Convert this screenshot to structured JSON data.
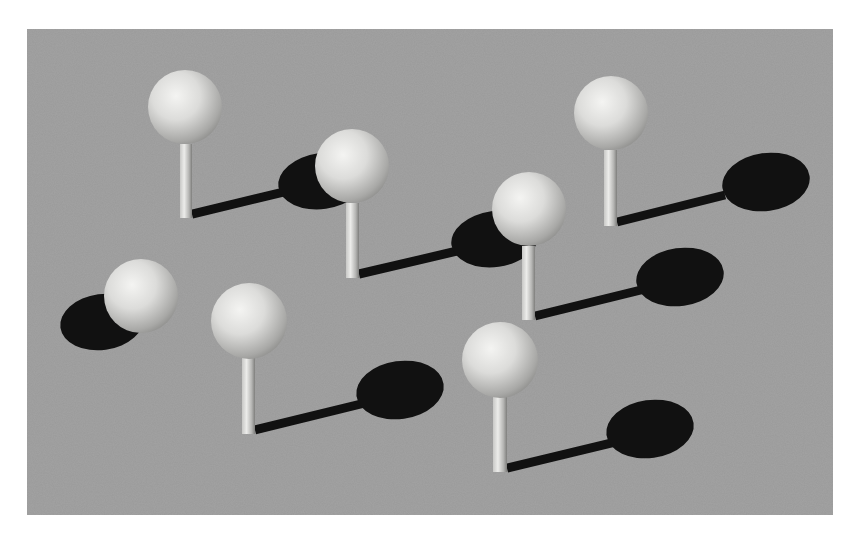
{
  "scene": {
    "description": "3D render of white spheres on short posts casting dark shadows on a gray textured ground plane",
    "panel": {
      "x": 27,
      "y": 29,
      "width": 806,
      "height": 486,
      "color": "#9a9a9a"
    },
    "colors": {
      "ground": "#9a9a9a",
      "shadow": "#111111",
      "sphere_light": "#f2f2f0",
      "sphere_mid": "#d4d4d2",
      "sphere_dark": "#8e8e8c",
      "post_light": "#e6e6e4",
      "post_dark": "#8a8a88"
    },
    "pins": [
      {
        "id": "pin-1",
        "sphere": {
          "cx": 185,
          "cy": 107,
          "r": 37
        },
        "post": {
          "x": 180,
          "y1": 144,
          "y2": 218,
          "w": 12
        },
        "shadow_line": {
          "x1": 192,
          "y1": 214,
          "x2": 300,
          "y2": 188
        },
        "shadow_ellipse": {
          "cx": 322,
          "cy": 181,
          "rx": 44,
          "ry": 28
        }
      },
      {
        "id": "pin-2",
        "sphere": {
          "cx": 352,
          "cy": 166,
          "r": 37
        },
        "post": {
          "x": 346,
          "y1": 203,
          "y2": 278,
          "w": 13
        },
        "shadow_line": {
          "x1": 359,
          "y1": 274,
          "x2": 470,
          "y2": 248
        },
        "shadow_ellipse": {
          "cx": 495,
          "cy": 239,
          "rx": 44,
          "ry": 28
        }
      },
      {
        "id": "pin-3",
        "sphere": {
          "cx": 529,
          "cy": 209,
          "r": 37
        },
        "post": {
          "x": 522,
          "y1": 246,
          "y2": 320,
          "w": 13
        },
        "shadow_line": {
          "x1": 535,
          "y1": 316,
          "x2": 645,
          "y2": 289
        },
        "shadow_ellipse": {
          "cx": 680,
          "cy": 277,
          "rx": 44,
          "ry": 29
        }
      },
      {
        "id": "pin-4",
        "sphere": {
          "cx": 611,
          "cy": 113,
          "r": 37
        },
        "post": {
          "x": 604,
          "y1": 150,
          "y2": 226,
          "w": 13
        },
        "shadow_line": {
          "x1": 617,
          "y1": 222,
          "x2": 725,
          "y2": 195
        },
        "shadow_ellipse": {
          "cx": 766,
          "cy": 182,
          "rx": 44,
          "ry": 29
        }
      },
      {
        "id": "pin-5",
        "sphere": {
          "cx": 141,
          "cy": 296,
          "r": 37
        },
        "post": null,
        "shadow_line": null,
        "shadow_ellipse": {
          "cx": 102,
          "cy": 322,
          "rx": 42,
          "ry": 28
        }
      },
      {
        "id": "pin-6",
        "sphere": {
          "cx": 249,
          "cy": 321,
          "r": 38
        },
        "post": {
          "x": 242,
          "y1": 358,
          "y2": 434,
          "w": 13
        },
        "shadow_line": {
          "x1": 255,
          "y1": 430,
          "x2": 365,
          "y2": 403
        },
        "shadow_ellipse": {
          "cx": 400,
          "cy": 390,
          "rx": 44,
          "ry": 29
        }
      },
      {
        "id": "pin-7",
        "sphere": {
          "cx": 500,
          "cy": 360,
          "r": 38
        },
        "post": {
          "x": 493,
          "y1": 397,
          "y2": 472,
          "w": 14
        },
        "shadow_line": {
          "x1": 507,
          "y1": 468,
          "x2": 615,
          "y2": 442
        },
        "shadow_ellipse": {
          "cx": 650,
          "cy": 429,
          "rx": 44,
          "ry": 29
        }
      }
    ]
  }
}
